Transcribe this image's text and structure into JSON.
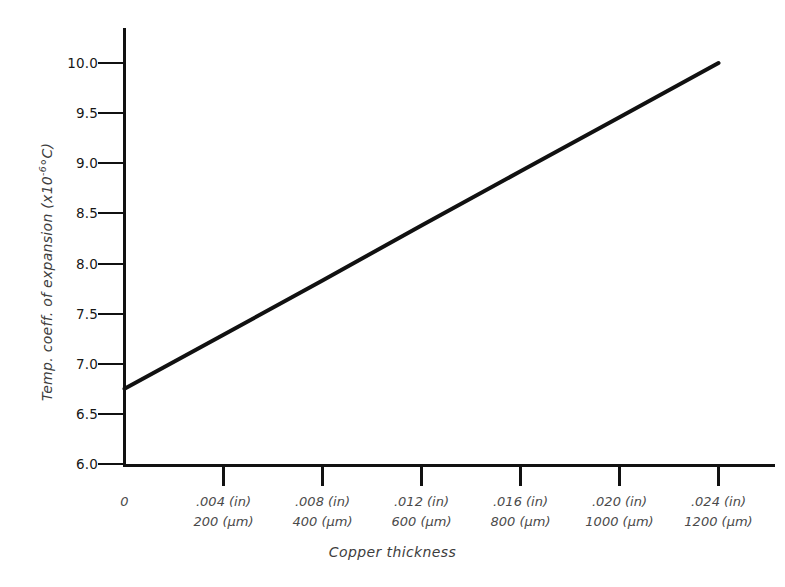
{
  "chart_data": {
    "type": "line",
    "title": "",
    "xlabel": "Copper thickness",
    "ylabel": "Temp. coeff. of expansion (x10-6°C)",
    "ylabel_parts": {
      "prefix": "Temp. coeff. of expansion (x10",
      "exponent": "-6",
      "suffix": "°C)"
    },
    "xlim": [
      0,
      0.0264
    ],
    "ylim": [
      6.0,
      10.0
    ],
    "grid": false,
    "legend": false,
    "x_unit_primary": "in",
    "x_unit_secondary": "µm",
    "y_tick_labels": [
      "10.0",
      "9.5",
      "9.0",
      "8.5",
      "8.0",
      "7.5",
      "7.0",
      "6.5",
      "6.0"
    ],
    "y_tick_values": [
      10.0,
      9.5,
      9.0,
      8.5,
      8.0,
      7.5,
      7.0,
      6.5,
      6.0
    ],
    "x_ticks": [
      {
        "origin": true,
        "label_line1": "0",
        "label_line2": "",
        "value_in": 0,
        "value_um": 0
      },
      {
        "origin": false,
        "label_line1": ".004 (in)",
        "label_line2": "200 (µm)",
        "value_in": 0.004,
        "value_um": 200
      },
      {
        "origin": false,
        "label_line1": ".008 (in)",
        "label_line2": "400 (µm)",
        "value_in": 0.008,
        "value_um": 400
      },
      {
        "origin": false,
        "label_line1": ".012 (in)",
        "label_line2": "600 (µm)",
        "value_in": 0.012,
        "value_um": 600
      },
      {
        "origin": false,
        "label_line1": ".016 (in)",
        "label_line2": "800 (µm)",
        "value_in": 0.016,
        "value_um": 800
      },
      {
        "origin": false,
        "label_line1": ".020 (in)",
        "label_line2": "1000 (µm)",
        "value_in": 0.02,
        "value_um": 1000
      },
      {
        "origin": false,
        "label_line1": ".024 (in)",
        "label_line2": "1200 (µm)",
        "value_in": 0.024,
        "value_um": 1200
      }
    ],
    "series": [
      {
        "name": "Temp. coeff. of expansion",
        "color": "#111111",
        "x_in": [
          0,
          0.024
        ],
        "x_um": [
          0,
          1200
        ],
        "values": [
          6.75,
          10.0
        ],
        "points": [
          {
            "x_in": 0,
            "x_um": 0,
            "y": 6.75
          },
          {
            "x_in": 0.004,
            "x_um": 200,
            "y": 7.29
          },
          {
            "x_in": 0.008,
            "x_um": 400,
            "y": 7.83
          },
          {
            "x_in": 0.012,
            "x_um": 600,
            "y": 8.38
          },
          {
            "x_in": 0.016,
            "x_um": 800,
            "y": 8.92
          },
          {
            "x_in": 0.02,
            "x_um": 1000,
            "y": 9.46
          },
          {
            "x_in": 0.024,
            "x_um": 1200,
            "y": 10.0
          }
        ]
      }
    ]
  },
  "axes": {
    "y_axis_name": "vertical-axis",
    "x_axis_name": "horizontal-axis"
  },
  "colors": {
    "line": "#111111",
    "axis": "#111111",
    "tick_label": "#171717",
    "axis_title": "#3d3d3d",
    "background": "#ffffff"
  }
}
